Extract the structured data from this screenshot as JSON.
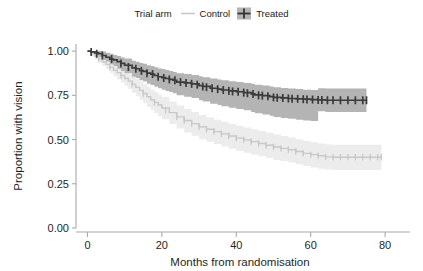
{
  "legend": {
    "title": "Trial arm",
    "entries": [
      {
        "label": "Control",
        "color": "#c8c8c8",
        "key_icon": "line-key-icon"
      },
      {
        "label": "Treated",
        "color": "#3a3a3a",
        "key_icon": "plus-key-icon"
      }
    ]
  },
  "axes": {
    "x": {
      "label": "Months from randomisation",
      "ticks": [
        "0",
        "20",
        "40",
        "60",
        "80"
      ],
      "tick_values": [
        0,
        20,
        40,
        60,
        80
      ],
      "min": -2,
      "max": 84
    },
    "y": {
      "label": "Proportion with vision",
      "ticks": [
        "0.00",
        "0.25",
        "0.50",
        "0.75",
        "1.00"
      ],
      "tick_values": [
        0.0,
        0.25,
        0.5,
        0.75,
        1.0
      ],
      "min": 0.0,
      "max": 1.04
    }
  },
  "chart_data": {
    "type": "line",
    "title": "",
    "subtitle": "",
    "xlabel": "Months from randomisation",
    "ylabel": "Proportion with vision",
    "xlim": [
      -2,
      84
    ],
    "ylim": [
      0.0,
      1.04
    ],
    "grid": false,
    "legend_position": "top-center",
    "legend_title": "Trial arm",
    "annotations": [],
    "series": [
      {
        "name": "Treated",
        "color": "#3a3a3a",
        "band_color": "#b4b4b4",
        "step": "hv",
        "x": [
          0,
          1,
          2,
          3,
          4,
          5,
          6,
          7,
          8,
          9,
          10,
          12,
          13,
          14,
          15,
          16,
          17,
          18,
          19,
          20,
          21,
          22,
          23,
          24,
          26,
          28,
          30,
          31,
          33,
          35,
          36,
          38,
          40,
          42,
          44,
          45,
          47,
          49,
          50,
          52,
          54,
          56,
          58,
          60,
          62,
          64,
          66,
          70,
          75
        ],
        "values": [
          1.0,
          0.995,
          0.99,
          0.985,
          0.975,
          0.965,
          0.955,
          0.95,
          0.94,
          0.93,
          0.92,
          0.905,
          0.9,
          0.89,
          0.885,
          0.875,
          0.87,
          0.862,
          0.855,
          0.85,
          0.845,
          0.84,
          0.835,
          0.825,
          0.82,
          0.815,
          0.805,
          0.8,
          0.79,
          0.785,
          0.78,
          0.775,
          0.77,
          0.765,
          0.758,
          0.752,
          0.748,
          0.742,
          0.738,
          0.735,
          0.732,
          0.73,
          0.728,
          0.726,
          0.724,
          0.722,
          0.722,
          0.722,
          0.722
        ],
        "ci_lower": [
          1.0,
          0.985,
          0.975,
          0.965,
          0.95,
          0.94,
          0.925,
          0.915,
          0.9,
          0.888,
          0.875,
          0.855,
          0.848,
          0.835,
          0.828,
          0.815,
          0.808,
          0.798,
          0.79,
          0.782,
          0.775,
          0.768,
          0.762,
          0.75,
          0.742,
          0.735,
          0.722,
          0.715,
          0.702,
          0.695,
          0.688,
          0.68,
          0.672,
          0.665,
          0.655,
          0.648,
          0.642,
          0.635,
          0.628,
          0.622,
          0.618,
          0.612,
          0.608,
          0.605,
          0.66,
          0.655,
          0.655,
          0.655,
          0.655
        ],
        "ci_upper": [
          1.0,
          1.0,
          1.0,
          1.0,
          0.998,
          0.99,
          0.985,
          0.978,
          0.972,
          0.965,
          0.958,
          0.945,
          0.94,
          0.932,
          0.928,
          0.92,
          0.915,
          0.908,
          0.902,
          0.898,
          0.893,
          0.888,
          0.882,
          0.875,
          0.87,
          0.865,
          0.858,
          0.852,
          0.845,
          0.84,
          0.835,
          0.83,
          0.825,
          0.82,
          0.815,
          0.81,
          0.805,
          0.8,
          0.795,
          0.792,
          0.788,
          0.785,
          0.782,
          0.78,
          0.79,
          0.788,
          0.788,
          0.788,
          0.788
        ],
        "censor_x": [
          1,
          2.5,
          4,
          6.5,
          9,
          11,
          13,
          14.5,
          16,
          17.5,
          19,
          20.5,
          22,
          23.5,
          25,
          26.5,
          28,
          29.5,
          31,
          32,
          33.5,
          35,
          36.5,
          38,
          39,
          40.5,
          42,
          43,
          44.5,
          46,
          47,
          48.5,
          50,
          51,
          52.5,
          54,
          55,
          56.5,
          58,
          59,
          60.5,
          62,
          63,
          64.5,
          66,
          68,
          70,
          72,
          74,
          75
        ],
        "censor_y": [
          0.995,
          0.985,
          0.975,
          0.955,
          0.93,
          0.91,
          0.9,
          0.888,
          0.875,
          0.87,
          0.855,
          0.848,
          0.84,
          0.835,
          0.825,
          0.82,
          0.815,
          0.81,
          0.8,
          0.796,
          0.79,
          0.785,
          0.78,
          0.775,
          0.772,
          0.77,
          0.765,
          0.762,
          0.758,
          0.75,
          0.748,
          0.745,
          0.738,
          0.736,
          0.735,
          0.732,
          0.731,
          0.73,
          0.728,
          0.727,
          0.726,
          0.724,
          0.723,
          0.722,
          0.722,
          0.722,
          0.722,
          0.722,
          0.722,
          0.722
        ]
      },
      {
        "name": "Control",
        "color": "#c8c8c8",
        "band_color": "#ececec",
        "step": "hv",
        "x": [
          0,
          1,
          2,
          3,
          4,
          5,
          6,
          7,
          8,
          9,
          10,
          11,
          12,
          13,
          14,
          15,
          16,
          17,
          18,
          19,
          20,
          22,
          24,
          26,
          28,
          30,
          32,
          34,
          36,
          38,
          40,
          42,
          44,
          46,
          48,
          50,
          52,
          54,
          56,
          58,
          60,
          62,
          64,
          66,
          70,
          74,
          79
        ],
        "values": [
          1.0,
          0.985,
          0.97,
          0.955,
          0.94,
          0.925,
          0.908,
          0.892,
          0.878,
          0.862,
          0.845,
          0.83,
          0.812,
          0.795,
          0.778,
          0.76,
          0.742,
          0.725,
          0.71,
          0.695,
          0.678,
          0.652,
          0.628,
          0.608,
          0.59,
          0.572,
          0.558,
          0.545,
          0.532,
          0.52,
          0.508,
          0.498,
          0.488,
          0.478,
          0.468,
          0.458,
          0.45,
          0.442,
          0.432,
          0.422,
          0.415,
          0.408,
          0.402,
          0.4,
          0.4,
          0.4,
          0.4
        ],
        "ci_lower": [
          1.0,
          0.972,
          0.952,
          0.935,
          0.915,
          0.898,
          0.878,
          0.858,
          0.84,
          0.822,
          0.802,
          0.785,
          0.765,
          0.745,
          0.725,
          0.705,
          0.685,
          0.668,
          0.65,
          0.632,
          0.615,
          0.588,
          0.562,
          0.54,
          0.522,
          0.502,
          0.488,
          0.475,
          0.46,
          0.448,
          0.435,
          0.425,
          0.415,
          0.405,
          0.395,
          0.385,
          0.378,
          0.37,
          0.36,
          0.35,
          0.342,
          0.335,
          0.33,
          0.328,
          0.328,
          0.328,
          0.328
        ],
        "ci_upper": [
          1.0,
          0.998,
          0.99,
          0.978,
          0.965,
          0.952,
          0.938,
          0.925,
          0.912,
          0.898,
          0.885,
          0.872,
          0.858,
          0.842,
          0.828,
          0.812,
          0.798,
          0.782,
          0.768,
          0.755,
          0.74,
          0.715,
          0.692,
          0.672,
          0.655,
          0.638,
          0.625,
          0.612,
          0.6,
          0.588,
          0.578,
          0.568,
          0.558,
          0.548,
          0.538,
          0.528,
          0.52,
          0.512,
          0.502,
          0.492,
          0.485,
          0.478,
          0.472,
          0.47,
          0.47,
          0.47,
          0.47
        ],
        "censor_x": [
          3,
          6,
          9,
          12,
          15,
          18,
          21,
          24,
          26,
          28,
          30,
          32,
          34,
          36,
          38,
          40,
          42,
          44,
          46,
          48,
          50,
          52,
          54,
          56,
          58,
          60,
          62,
          64,
          66,
          68,
          70,
          72,
          74,
          76,
          78,
          79
        ],
        "censor_y": [
          0.955,
          0.908,
          0.862,
          0.812,
          0.76,
          0.71,
          0.665,
          0.628,
          0.608,
          0.59,
          0.572,
          0.558,
          0.545,
          0.532,
          0.52,
          0.508,
          0.498,
          0.488,
          0.478,
          0.468,
          0.458,
          0.45,
          0.442,
          0.432,
          0.422,
          0.415,
          0.408,
          0.402,
          0.4,
          0.4,
          0.4,
          0.4,
          0.4,
          0.4,
          0.4,
          0.4
        ]
      }
    ]
  }
}
